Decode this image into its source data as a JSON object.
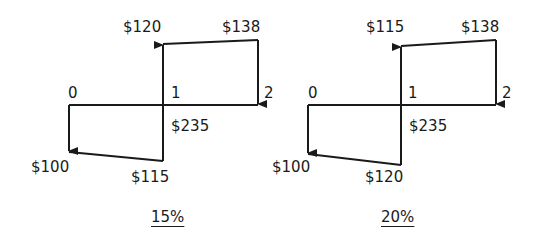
{
  "diagrams": [
    {
      "caption": "15%",
      "period_labels": [
        "0",
        "1",
        "2"
      ],
      "labels": {
        "p1_up_top": "$120",
        "p2_top": "$138",
        "p1_right": "$235",
        "p0_down": "$100",
        "p1_down_bottom": "$115"
      }
    },
    {
      "caption": "20%",
      "period_labels": [
        "0",
        "1",
        "2"
      ],
      "labels": {
        "p1_up_top": "$115",
        "p2_top": "$138",
        "p1_right": "$235",
        "p0_down": "$100",
        "p1_down_bottom": "$120"
      }
    }
  ],
  "colors": {
    "line": "#1a1a1a",
    "background": "#ffffff"
  }
}
